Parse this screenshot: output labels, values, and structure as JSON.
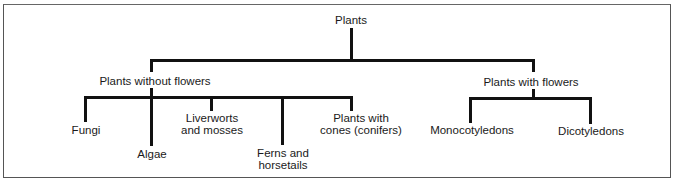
{
  "diagram": {
    "type": "tree",
    "root": {
      "label": "Plants",
      "children": [
        {
          "label": "Plants without flowers",
          "children": [
            {
              "label": "Fungi"
            },
            {
              "label": "Algae"
            },
            {
              "label": "Liverworts and mosses",
              "lines": [
                "Liverworts",
                "and mosses"
              ]
            },
            {
              "label": "Ferns and horsetails",
              "lines": [
                "Ferns and",
                "horsetails"
              ]
            },
            {
              "label": "Plants with cones (conifers)",
              "lines": [
                "Plants with",
                "cones (conifers)"
              ]
            }
          ]
        },
        {
          "label": "Plants with flowers",
          "children": [
            {
              "label": "Monocotyledons"
            },
            {
              "label": "Dicotyledons"
            }
          ]
        }
      ]
    }
  },
  "labels": {
    "root": "Plants",
    "without_flowers": "Plants without flowers",
    "with_flowers": "Plants with flowers",
    "fungi": "Fungi",
    "algae": "Algae",
    "liverworts_1": "Liverworts",
    "liverworts_2": "and mosses",
    "ferns_1": "Ferns and",
    "ferns_2": "horsetails",
    "conifers_1": "Plants with",
    "conifers_2": "cones (conifers)",
    "monocots": "Monocotyledons",
    "dicots": "Dicotyledons"
  }
}
